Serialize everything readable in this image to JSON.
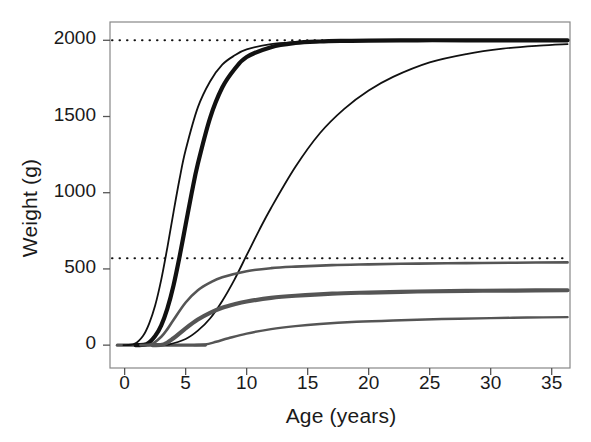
{
  "chart_data": {
    "type": "line",
    "title": "",
    "xlabel": "Age (years)",
    "ylabel": "Weight (g)",
    "xlim": [
      -1.2,
      36.5
    ],
    "ylim": [
      -150,
      2120
    ],
    "xticks": [
      0,
      5,
      10,
      15,
      20,
      25,
      30,
      35
    ],
    "xticklabels": [
      "0",
      "5",
      "10",
      "15",
      "20",
      "25",
      "30",
      "35"
    ],
    "yticks": [
      0,
      500,
      1000,
      1500,
      2000
    ],
    "yticklabels": [
      "0",
      "500",
      "1000",
      "1500",
      "2000"
    ],
    "grid": false,
    "legend": null,
    "reference_lines": [
      {
        "name": "upper-asymptote-reference",
        "y": 2000,
        "style": "dotted",
        "color": "#111111"
      },
      {
        "name": "lower-asymptote-reference",
        "y": 570,
        "style": "dotted",
        "color": "#111111"
      }
    ],
    "series": [
      {
        "name": "curve-large-early",
        "color": "#111111",
        "width": 1.8,
        "asymptote": 2000,
        "inflection_age": 4.0,
        "rate": 0.62,
        "onset_age": 0.8,
        "x": [
          0.8,
          1.5,
          2,
          2.5,
          3,
          3.5,
          4,
          4.5,
          5,
          6,
          7,
          8,
          9,
          10,
          12,
          14,
          16,
          18,
          20,
          24,
          28,
          32,
          36.3
        ],
        "y": [
          8,
          60,
          140,
          260,
          430,
          640,
          870,
          1090,
          1280,
          1560,
          1730,
          1840,
          1900,
          1940,
          1975,
          1988,
          1994,
          1997,
          1998,
          2000,
          2000,
          2000,
          2000
        ]
      },
      {
        "name": "curve-large-mid-bold",
        "color": "#111111",
        "width": 4.2,
        "asymptote": 2000,
        "inflection_age": 5.6,
        "rate": 0.52,
        "onset_age": 1.8,
        "x": [
          1.8,
          2.5,
          3,
          3.5,
          4,
          4.5,
          5,
          5.5,
          6,
          7,
          8,
          9,
          10,
          12,
          14,
          16,
          18,
          20,
          24,
          28,
          32,
          36.3
        ],
        "y": [
          6,
          60,
          130,
          240,
          390,
          580,
          790,
          1000,
          1190,
          1490,
          1690,
          1810,
          1890,
          1955,
          1982,
          1992,
          1996,
          1998,
          2000,
          2000,
          2000,
          2000
        ]
      },
      {
        "name": "curve-large-late",
        "color": "#111111",
        "width": 1.8,
        "asymptote": 2000,
        "inflection_age": 10.5,
        "rate": 0.26,
        "onset_age": 3.6,
        "x": [
          3.6,
          5,
          6,
          7,
          8,
          9,
          10,
          11,
          12,
          14,
          16,
          18,
          20,
          22,
          25,
          28,
          31,
          34,
          36.3
        ],
        "y": [
          4,
          40,
          95,
          175,
          290,
          430,
          590,
          750,
          900,
          1170,
          1390,
          1550,
          1670,
          1760,
          1855,
          1910,
          1945,
          1965,
          1975
        ]
      },
      {
        "name": "curve-small-early",
        "color": "#555555",
        "width": 2.6,
        "asymptote": 545,
        "inflection_age": 4.2,
        "rate": 0.4,
        "onset_age": 2.2,
        "x": [
          2.2,
          3,
          3.5,
          4,
          5,
          6,
          7,
          8,
          10,
          12,
          14,
          17,
          20,
          24,
          28,
          32,
          36.3
        ],
        "y": [
          6,
          55,
          105,
          165,
          280,
          360,
          410,
          445,
          485,
          505,
          515,
          525,
          530,
          535,
          538,
          541,
          543
        ]
      },
      {
        "name": "curve-small-mid-bold",
        "color": "#555555",
        "width": 4.2,
        "asymptote": 360,
        "inflection_age": 5.0,
        "rate": 0.32,
        "onset_age": 3.2,
        "x": [
          3.2,
          4,
          5,
          6,
          7,
          8,
          9,
          10,
          12,
          14,
          17,
          20,
          24,
          28,
          32,
          36.3
        ],
        "y": [
          5,
          45,
          110,
          168,
          212,
          245,
          268,
          286,
          310,
          324,
          338,
          345,
          352,
          356,
          358,
          360
        ]
      },
      {
        "name": "curve-small-late",
        "color": "#555555",
        "width": 2.4,
        "asymptote": 185,
        "inflection_age": 9.5,
        "rate": 0.22,
        "onset_age": 6.6,
        "x": [
          6.6,
          7.5,
          8.5,
          10,
          12,
          14,
          16,
          19,
          22,
          26,
          30,
          33,
          36.3
        ],
        "y": [
          4,
          22,
          45,
          76,
          105,
          125,
          139,
          153,
          162,
          171,
          177,
          181,
          184
        ]
      }
    ],
    "baseline_segment": {
      "name": "zero-baseline",
      "color": "#555555",
      "x": [
        -0.6,
        6.6
      ],
      "y": 0
    }
  },
  "axes": {
    "frame_color": "#888888",
    "tick_color": "#555555"
  }
}
